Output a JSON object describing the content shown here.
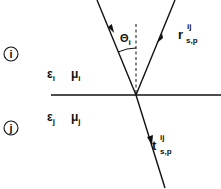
{
  "diagram": {
    "media": [
      {
        "id": "i",
        "circle_label": "i",
        "epsilon": "ε",
        "epsilon_sub": "i",
        "mu": "μ",
        "mu_sub": "i"
      },
      {
        "id": "j",
        "circle_label": "j",
        "epsilon": "ε",
        "epsilon_sub": "j",
        "mu": "μ",
        "mu_sub": "j"
      }
    ],
    "angle": {
      "symbol": "Θ",
      "sub": "i"
    },
    "reflected": {
      "symbol": "r",
      "sup": "ij",
      "sub": "s,p"
    },
    "transmitted": {
      "symbol": "t",
      "sup": "ij",
      "sub": "s,p"
    },
    "colors": {
      "line": "#111111",
      "background": "#ffffff"
    }
  }
}
